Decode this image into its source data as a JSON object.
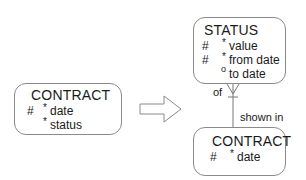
{
  "entities": {
    "contract_left": {
      "name": "CONTRACT",
      "attributes": [
        {
          "key": "#",
          "optionality": "*",
          "name": "date"
        },
        {
          "key": "",
          "optionality": "*",
          "name": "status"
        }
      ]
    },
    "status": {
      "name": "STATUS",
      "attributes": [
        {
          "key": "#",
          "optionality": "*",
          "name": "value"
        },
        {
          "key": "#",
          "optionality": "*",
          "name": "from date"
        },
        {
          "key": "",
          "optionality": "o",
          "name": "to date"
        }
      ]
    },
    "contract_right": {
      "name": "CONTRACT",
      "attributes": [
        {
          "key": "#",
          "optionality": "*",
          "name": "date"
        }
      ]
    }
  },
  "relationship": {
    "label_status_end": "of",
    "label_contract_end": "shown in"
  },
  "transform_arrow": "hollow-right-arrow"
}
